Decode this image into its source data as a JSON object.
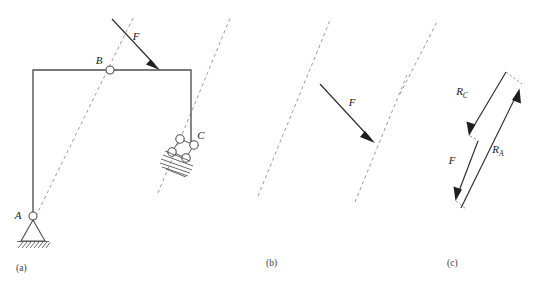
{
  "figure": {
    "background_color": "#ffffff",
    "member_color": "#4d4d4d",
    "dashed_axis_color": "#9a9a9a",
    "vector_color": "#2b2b2b",
    "width": 538,
    "height": 283
  },
  "panels": [
    {
      "key": "a",
      "caption": "(a)",
      "caption_x": 16,
      "caption_y": 270,
      "description": "Bent frame ABC with pin support at A, applied force F at B, roller support at C",
      "labels": {
        "point_a": "A",
        "point_b": "B",
        "point_c": "C",
        "force": "F"
      },
      "label_positions": {
        "point_a": {
          "x": 18,
          "y": 219
        },
        "point_b": {
          "x": 99,
          "y": 64
        },
        "point_c": {
          "x": 199,
          "y": 138
        },
        "force": {
          "x": 134,
          "y": 39
        }
      },
      "frame_path": "M 33 216 L 33 70 L 191 70 L 191 143",
      "joints": [
        {
          "name": "joint-a",
          "x": 33,
          "y": 216,
          "r": 4
        },
        {
          "name": "joint-b",
          "x": 110,
          "y": 70,
          "r": 4
        }
      ],
      "pin_support": {
        "triangle": "M 33 220 L 20 241 L 46 241 Z",
        "ground_x": 18,
        "ground_y": 241,
        "ground_w": 30,
        "hatch_count": 9
      },
      "roller_support": {
        "circles": [
          {
            "x": 180,
            "y": 139,
            "r": 4.2
          },
          {
            "x": 194,
            "y": 145,
            "r": 4.2
          },
          {
            "x": 172,
            "y": 152,
            "r": 4.2
          },
          {
            "x": 186,
            "y": 158,
            "r": 4.2
          }
        ],
        "links": [
          "M 180 139 L 194 145",
          "M 172 152 L 186 158",
          "M 180 139 L 172 152",
          "M 194 145 L 186 158"
        ],
        "hatch_count": 8
      },
      "force_arrow": {
        "from_x": 112,
        "from_y": 19,
        "to_x": 160,
        "to_y": 70,
        "label": "F"
      },
      "dashed_axes": [
        {
          "name": "axis-through-a-b",
          "x1": 33,
          "y1": 222,
          "x2": 134,
          "y2": 16
        },
        {
          "name": "axis-through-c",
          "x1": 158,
          "y1": 193,
          "x2": 231,
          "y2": 16
        }
      ]
    },
    {
      "key": "b",
      "caption": "(b)",
      "caption_x": 266,
      "caption_y": 265,
      "description": "Two parallel action lines with force F transferred between them",
      "labels": {
        "force": "F"
      },
      "label_positions": {
        "force": {
          "x": 350,
          "y": 105
        }
      },
      "dashed_axes": [
        {
          "name": "axis-left",
          "x1": 258,
          "y1": 196,
          "x2": 331,
          "y2": 18
        },
        {
          "name": "axis-right",
          "x1": 355,
          "y1": 202,
          "x2": 407,
          "y2": 75
        }
      ],
      "force_arrow": {
        "from_x": 320,
        "from_y": 84,
        "to_x": 374,
        "to_y": 142,
        "label": "F"
      }
    },
    {
      "key": "c",
      "caption": "(c)",
      "caption_x": 447,
      "caption_y": 265,
      "description": "Closed force polygon of F, R_C and R_A",
      "labels": {
        "reaction_c": "R",
        "reaction_c_sub": "C",
        "reaction_a": "R",
        "reaction_a_sub": "A",
        "force": "F"
      },
      "label_positions": {
        "reaction_c": {
          "x": 462,
          "y": 94
        },
        "reaction_a": {
          "x": 497,
          "y": 152
        },
        "force": {
          "x": 451,
          "y": 163
        }
      },
      "dashed_axis": {
        "name": "axis-stray",
        "x1": 400,
        "y1": 94,
        "x2": 437,
        "y2": 22
      },
      "vectors": [
        {
          "name": "vector-rc",
          "label": "R_C",
          "from_x": 506,
          "from_y": 72,
          "to_x": 470,
          "to_y": 136
        },
        {
          "name": "vector-f",
          "label": "F",
          "from_x": 478,
          "from_y": 141,
          "to_x": 456,
          "to_y": 201
        },
        {
          "name": "vector-ra",
          "label": "R_A",
          "from_x": 461,
          "from_y": 208,
          "to_x": 519,
          "to_y": 89
        }
      ],
      "closing_lines": [
        {
          "name": "closing-top",
          "x1": 506,
          "y1": 72,
          "x2": 522,
          "y2": 84
        },
        {
          "name": "closing-mid",
          "x1": 470,
          "y1": 136,
          "x2": 478,
          "y2": 141
        },
        {
          "name": "closing-bottom",
          "x1": 456,
          "y1": 201,
          "x2": 466,
          "y2": 209
        }
      ]
    }
  ]
}
